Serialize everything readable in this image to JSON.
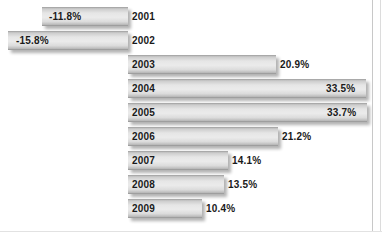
{
  "chart_data": {
    "type": "bar",
    "orientation": "horizontal",
    "title": "",
    "subtitle": "",
    "xlabel": "",
    "ylabel": "",
    "grid": false,
    "legend": null,
    "axis_zero_label": "0%",
    "xlim": [
      -15.8,
      33.7
    ],
    "categories": [
      "2001",
      "2002",
      "2003",
      "2004",
      "2005",
      "2006",
      "2007",
      "2008",
      "2009"
    ],
    "values": [
      -11.8,
      -15.8,
      20.9,
      33.5,
      33.7,
      21.2,
      14.1,
      13.5,
      10.4
    ],
    "value_labels": [
      "-11.8%",
      "-15.8%",
      "20.9%",
      "33.5%",
      "33.7%",
      "21.2%",
      "14.1%",
      "13.5%",
      "10.4%"
    ],
    "colors": {
      "bar_light": "#ebebeb",
      "bar_mid": "#d8d8d8",
      "bar_dark": "#b4b4b4",
      "text": "#1a1a1a",
      "background": "#ffffff",
      "frame": "#c8c8c8"
    }
  },
  "rows": [
    {
      "year": "2001",
      "value_label": "-11.8%",
      "value": -11.8,
      "negative": true,
      "bar_left": 42,
      "bar_width": 86,
      "label_left": 49,
      "row_top": 5
    },
    {
      "year": "2002",
      "value_label": "-15.8%",
      "value": -15.8,
      "negative": true,
      "bar_left": 8,
      "bar_width": 120,
      "label_left": 16,
      "row_top": 29
    },
    {
      "year": "2003",
      "value_label": "20.9%",
      "value": 20.9,
      "negative": false,
      "bar_left": 128,
      "bar_width": 148,
      "label_left": 280,
      "row_top": 53
    },
    {
      "year": "2004",
      "value_label": "33.5%",
      "value": 33.5,
      "negative": false,
      "bar_left": 128,
      "bar_width": 238,
      "label_left": 326,
      "row_top": 77
    },
    {
      "year": "2005",
      "value_label": "33.7%",
      "value": 33.7,
      "negative": false,
      "bar_left": 128,
      "bar_width": 239,
      "label_left": 327,
      "row_top": 101
    },
    {
      "year": "2006",
      "value_label": "21.2%",
      "value": 21.2,
      "negative": false,
      "bar_left": 128,
      "bar_width": 150,
      "label_left": 282,
      "row_top": 125
    },
    {
      "year": "2007",
      "value_label": "14.1%",
      "value": 14.1,
      "negative": false,
      "bar_left": 128,
      "bar_width": 100,
      "label_left": 232,
      "row_top": 149
    },
    {
      "year": "2008",
      "value_label": "13.5%",
      "value": 13.5,
      "negative": false,
      "bar_left": 128,
      "bar_width": 96,
      "label_left": 228,
      "row_top": 173
    },
    {
      "year": "2009",
      "value_label": "10.4%",
      "value": 10.4,
      "negative": false,
      "bar_left": 128,
      "bar_width": 74,
      "label_left": 206,
      "row_top": 197
    }
  ]
}
